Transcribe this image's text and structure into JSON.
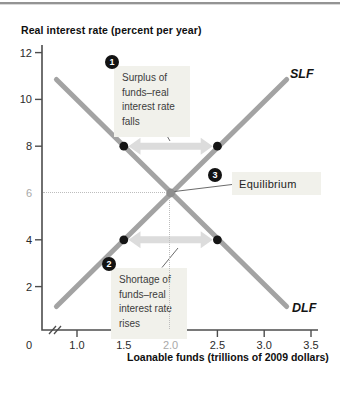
{
  "figure": {
    "y_axis_title": "Real interest rate (percent per year)",
    "x_axis_title": "Loanable funds (trillions of 2009 dollars)",
    "origin_label": "0"
  },
  "chart_data": {
    "type": "line",
    "xlabel": "Loanable funds (trillions of 2009 dollars)",
    "ylabel": "Real interest rate (percent per year)",
    "xlim": [
      0.5,
      3.5
    ],
    "ylim": [
      0,
      12
    ],
    "x_axis_break": true,
    "grid": false,
    "y_ticks": [
      {
        "value": 12,
        "label": "12",
        "muted": false,
        "tick": true
      },
      {
        "value": 10,
        "label": "10",
        "muted": false,
        "tick": true
      },
      {
        "value": 8,
        "label": "8",
        "muted": false,
        "tick": true
      },
      {
        "value": 6,
        "label": "6",
        "muted": true,
        "tick": false
      },
      {
        "value": 4,
        "label": "4",
        "muted": false,
        "tick": true
      },
      {
        "value": 2,
        "label": "2",
        "muted": false,
        "tick": true
      }
    ],
    "x_ticks": [
      {
        "value": 1.0,
        "label": "1.0",
        "muted": false,
        "tick": true
      },
      {
        "value": 1.5,
        "label": "1.5",
        "muted": false,
        "tick": true
      },
      {
        "value": 2.0,
        "label": "2.0",
        "muted": true,
        "tick": false
      },
      {
        "value": 2.5,
        "label": "2.5",
        "muted": false,
        "tick": true
      },
      {
        "value": 3.0,
        "label": "3.0",
        "muted": false,
        "tick": true
      },
      {
        "value": 3.5,
        "label": "3.5",
        "muted": false,
        "tick": true
      }
    ],
    "series": [
      {
        "name": "SLF",
        "points": [
          [
            0.78,
            1.15
          ],
          [
            3.24,
            10.85
          ]
        ],
        "color": "#a3a3a3"
      },
      {
        "name": "DLF",
        "points": [
          [
            0.78,
            10.85
          ],
          [
            3.24,
            1.15
          ]
        ],
        "color": "#a3a3a3"
      }
    ],
    "equilibrium": {
      "x": 2.0,
      "y": 6,
      "color": "#8f8f8f"
    },
    "markers": {
      "color": "#151515",
      "points": [
        [
          1.5,
          8
        ],
        [
          2.5,
          8
        ],
        [
          1.5,
          4
        ],
        [
          2.5,
          4
        ]
      ]
    },
    "gap_arrows": [
      {
        "r": 8,
        "q1": 1.55,
        "q2": 2.45
      },
      {
        "r": 4,
        "q1": 1.55,
        "q2": 2.45
      }
    ],
    "guide_lines": {
      "x": 2.0,
      "y": 6
    },
    "legend": "none",
    "colors": {
      "curve": "#a3a3a3",
      "arrow_fill": "#dcdcdc",
      "axis": "#4d4d4d",
      "guide": "#bdbdbd",
      "tick_label": "#2b2b2b",
      "muted_label": "#a9a9a9"
    }
  },
  "annotations": {
    "surplus": {
      "badge": "1",
      "lines": [
        "Surplus of",
        "funds–real",
        "interest rate",
        "falls"
      ]
    },
    "shortage": {
      "badge": "2",
      "lines": [
        "Shortage of",
        "funds–real",
        "interest rate",
        "rises"
      ]
    },
    "equilibrium": {
      "badge": "3",
      "label": "Equilibrium"
    }
  }
}
